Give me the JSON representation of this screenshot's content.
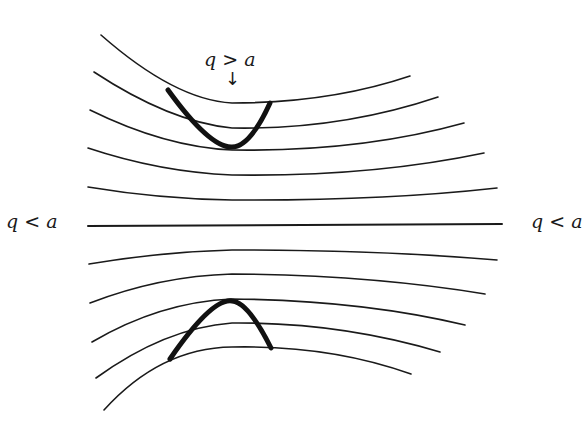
{
  "diagram": {
    "type": "flow-lines",
    "labels": {
      "top": "q > a",
      "left": "q < a",
      "right": "q < a"
    },
    "annotations": {
      "top_arrow": "↓"
    },
    "line_color": "#1a1a1a",
    "background": "#ffffff",
    "thin_curves": {
      "upper": [
        "M101,35 Q175,100 232,103 Q330,103 410,76",
        "M94,72 Q170,122 232,128 Q340,130 438,97",
        "M90,110 Q165,147 232,150 Q360,152 464,123",
        "M88,148 Q160,172 232,175 Q370,177 484,153",
        "M88,187 Q160,199 232,200 Q380,201 497,188"
      ],
      "center": "M88,226 L502,224",
      "lower": [
        "M89,264 Q160,252 232,250 Q380,250 497,260",
        "M90,303 Q160,276 232,274 Q370,275 485,294",
        "M92,342 Q160,302 232,299 Q360,300 465,325",
        "M96,378 Q165,328 232,323 Q340,322 440,352",
        "M104,410 Q160,348 232,347 Q330,345 411,374"
      ]
    },
    "bold_curves": {
      "upper": "M168,90 Q210,148 232,147 Q250,147 270,103",
      "lower": "M170,359 Q212,298 232,301 Q248,302 271,348"
    }
  }
}
